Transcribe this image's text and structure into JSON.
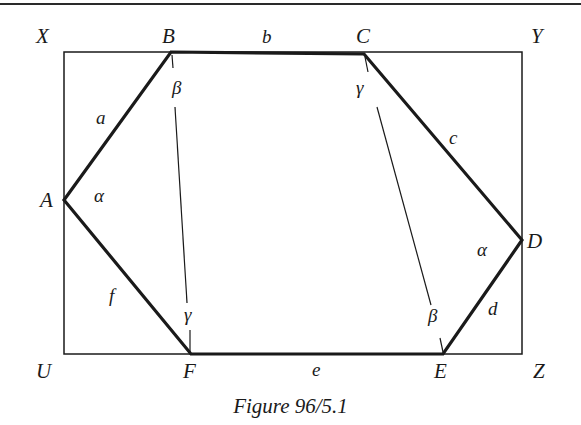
{
  "figure": {
    "caption": "Figure 96/5.1",
    "colors": {
      "ink": "#1a1a1a",
      "background": "#ffffff"
    }
  },
  "rectangle": {
    "corners": {
      "X": "X",
      "Y": "Y",
      "Z": "Z",
      "U": "U"
    },
    "coords": {
      "left": 64,
      "top": 52,
      "right": 522,
      "bottom": 354
    }
  },
  "hexagon": {
    "vertices": {
      "A": {
        "label": "A",
        "x": 64,
        "y": 200
      },
      "B": {
        "label": "B",
        "x": 171,
        "y": 52
      },
      "C": {
        "label": "C",
        "x": 364,
        "y": 54
      },
      "D": {
        "label": "D",
        "x": 522,
        "y": 240
      },
      "E": {
        "label": "E",
        "x": 443,
        "y": 354
      },
      "F": {
        "label": "F",
        "x": 191,
        "y": 354
      }
    },
    "sides": {
      "a": "a",
      "b": "b",
      "c": "c",
      "d": "d",
      "e": "e",
      "f": "f"
    }
  },
  "angles": {
    "A": "α",
    "B": "β",
    "C": "γ",
    "D": "α",
    "E": "β",
    "F": "γ"
  },
  "diagonals": [
    {
      "from": "B",
      "to": "F",
      "x1": 173,
      "y1": 56,
      "x2": 190,
      "y2": 350
    },
    {
      "from": "C",
      "to": "E",
      "x1": 366,
      "y1": 58,
      "x2": 440,
      "y2": 350
    }
  ]
}
